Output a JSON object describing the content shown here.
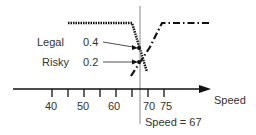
{
  "diagram": {
    "labels": {
      "legal": "Legal",
      "risky": "Risky",
      "legal_value": "0.4",
      "risky_value": "0.2",
      "axis_label": "Speed",
      "marker_label": "Speed  = 67"
    },
    "ticks": [
      "40",
      "50",
      "60",
      "70",
      "75"
    ],
    "colors": {
      "line": "#111111",
      "text": "#333333",
      "marker": "#888888"
    }
  }
}
